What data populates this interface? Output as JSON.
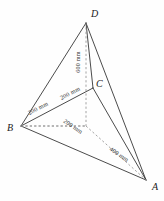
{
  "figure": {
    "vertices": [
      {
        "id": "A",
        "label": "A",
        "x": 146,
        "y": 180,
        "label_x": 152,
        "label_y": 190
      },
      {
        "id": "B",
        "label": "B",
        "x": 21,
        "y": 126,
        "label_x": 7,
        "label_y": 131
      },
      {
        "id": "C",
        "label": "C",
        "x": 93,
        "y": 88,
        "label_x": 96,
        "label_y": 87
      },
      {
        "id": "D",
        "label": "D",
        "x": 86,
        "y": 23,
        "label_x": 91,
        "label_y": 17
      },
      {
        "id": "O",
        "label": "",
        "x": 86,
        "y": 126,
        "label_x": 0,
        "label_y": 0
      }
    ],
    "dimensions": [
      {
        "id": "bc-lower",
        "text": "200 mm",
        "x": 39,
        "y": 110,
        "rotate": -28
      },
      {
        "id": "bc-upper",
        "text": "200 mm",
        "x": 71,
        "y": 95,
        "rotate": -28
      },
      {
        "id": "do-height",
        "text": "600 mm",
        "x": 80,
        "y": 62,
        "rotate": -90
      },
      {
        "id": "bo-base",
        "text": "200 mm",
        "x": 72,
        "y": 128,
        "rotate": 34
      },
      {
        "id": "oa-base",
        "text": "400 mm",
        "x": 118,
        "y": 156,
        "rotate": 34
      }
    ],
    "edges_solid": [
      {
        "id": "edge-D-B",
        "from": "D",
        "to": "B"
      },
      {
        "id": "edge-D-C",
        "from": "D",
        "to": "C"
      },
      {
        "id": "edge-D-A",
        "from": "D",
        "to": "A"
      },
      {
        "id": "edge-B-C",
        "from": "B",
        "to": "C"
      },
      {
        "id": "edge-C-A",
        "from": "C",
        "to": "A"
      },
      {
        "id": "edge-B-A",
        "from": "B",
        "to": "A"
      }
    ],
    "edges_dashed": [
      {
        "id": "edge-D-O",
        "from": "D",
        "to": "O"
      },
      {
        "id": "edge-B-O",
        "from": "B",
        "to": "O"
      },
      {
        "id": "edge-O-A",
        "from": "O",
        "to": "A"
      }
    ],
    "colors": {
      "solid_edge": "#2b2b2b",
      "dashed_edge": "#8d8d8d",
      "label_text": "#1a1a1a",
      "dimension_text": "#333333",
      "background": "#fefefe"
    }
  }
}
